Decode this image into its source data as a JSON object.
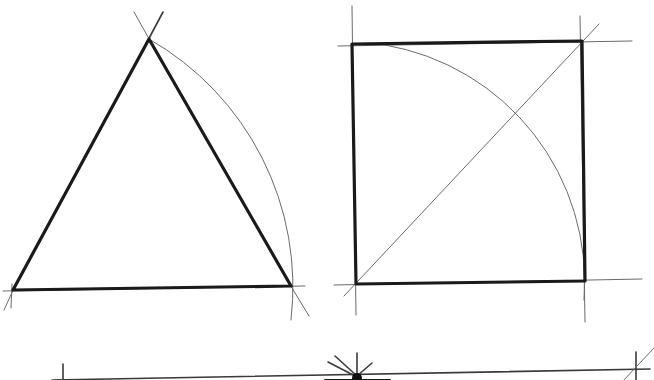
{
  "diagram": {
    "type": "geometric-construction",
    "colors": {
      "background": "#ffffff",
      "heavy_stroke": "#1a1a1a",
      "light_stroke": "#6a6a6a",
      "medium_stroke": "#3a3a3a"
    },
    "figures": [
      {
        "id": "equilateral-triangle",
        "name": "Equilateral triangle construction",
        "vertices": {
          "apex": [
            149,
            39
          ],
          "bottom_left": [
            13,
            290
          ],
          "bottom_right": [
            291,
            286
          ]
        },
        "construction": {
          "baseline": [
            [
              3,
              291
            ],
            [
              305,
              286
            ]
          ],
          "arc": {
            "center": [
              13,
              290
            ],
            "radius": 285,
            "from": [
              149,
              39
            ],
            "to": [
              291,
              320
            ]
          },
          "apex_cross_lines": [
            [
              [
                134,
                12
              ],
              [
                149,
                39
              ]
            ],
            [
              [
                163,
                12
              ],
              [
                149,
                39
              ]
            ]
          ],
          "bottom_right_extensions": [
            [
              [
                291,
                286
              ],
              [
                309,
                316
              ]
            ]
          ],
          "bottom_left_extensions": [
            [
              [
                13,
                290
              ],
              [
                4,
                310
              ]
            ],
            [
              [
                13,
                290
              ],
              [
                11,
                308
              ]
            ]
          ]
        }
      },
      {
        "id": "square",
        "name": "Square construction with diagonal and quarter arc",
        "vertices": {
          "top_left": [
            352,
            44
          ],
          "top_right": [
            582,
            41
          ],
          "bottom_left": [
            356,
            284
          ],
          "bottom_right": [
            585,
            281
          ]
        },
        "construction": {
          "top_line": [
            [
              338,
              46
            ],
            [
              632,
              41
            ]
          ],
          "bottom_line": [
            [
              334,
              285
            ],
            [
              642,
              279
            ]
          ],
          "left_line": [
            [
              352,
              6
            ],
            [
              356,
              315
            ]
          ],
          "right_line": [
            [
              580,
              16
            ],
            [
              585,
              322
            ]
          ],
          "diagonal": [
            [
              344,
              296
            ],
            [
              599,
              24
            ]
          ],
          "arc": {
            "center": [
              356,
              284
            ],
            "radius": 240,
            "from": [
              352,
              44
            ],
            "to": [
              584,
              300
            ]
          }
        }
      },
      {
        "id": "bottom-construction",
        "name": "Partial construction line (cropped)",
        "construction": {
          "baseline": [
            [
              52,
              380
            ],
            [
              650,
              369
            ]
          ],
          "left_tick": [
            [
              63,
              364
            ],
            [
              63,
              380
            ]
          ],
          "star_center": [
            356,
            376
          ],
          "right_tick": [
            [
              636,
              352
            ],
            [
              636,
              380
            ]
          ],
          "right_diagonal": [
            [
              622,
              382
            ],
            [
              654,
              348
            ]
          ]
        }
      }
    ]
  }
}
